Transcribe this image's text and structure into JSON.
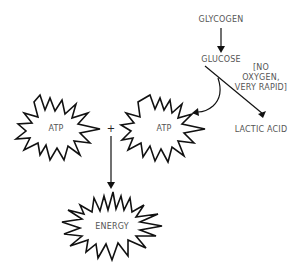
{
  "diagram": {
    "nodes": {
      "glycogen": "GLYCOGEN",
      "glucose": "GLUCOSE",
      "lactic_acid": "LACTIC ACID",
      "atp_left": "ATP",
      "atp_right": "ATP",
      "energy": "ENERGY",
      "plus": "+"
    },
    "annotation": {
      "line1": "[NO",
      "line2": "OXYGEN,",
      "line3": "VERY RAPID]"
    },
    "colors": {
      "stroke": "#111111",
      "text": "#555555",
      "background": "#ffffff"
    }
  }
}
